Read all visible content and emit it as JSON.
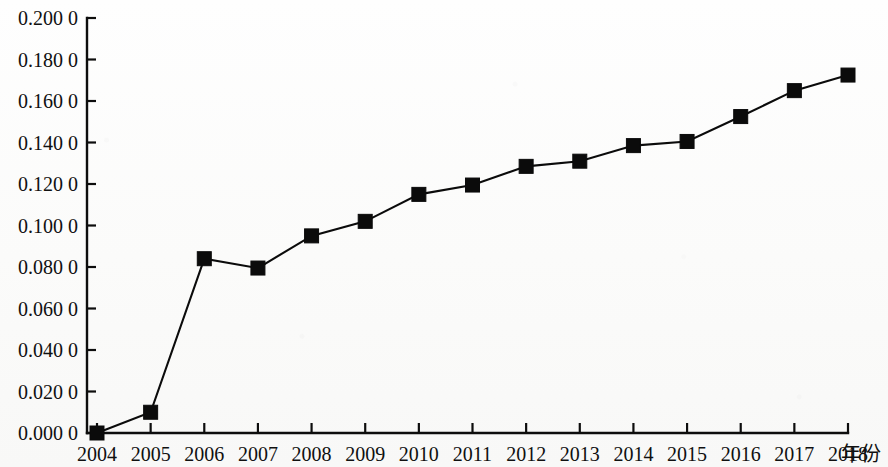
{
  "chart_data": {
    "type": "line",
    "title": "",
    "subtitle": "",
    "xlabel": "年份",
    "ylabel": "",
    "grid": false,
    "legend": null,
    "categories": [
      "2004",
      "2005",
      "2006",
      "2007",
      "2008",
      "2009",
      "2010",
      "2011",
      "2012",
      "2013",
      "2014",
      "2015",
      "2016",
      "2017",
      "2018"
    ],
    "x": [
      2004,
      2005,
      2006,
      2007,
      2008,
      2009,
      2010,
      2011,
      2012,
      2013,
      2014,
      2015,
      2016,
      2017,
      2018
    ],
    "values": [
      0.0,
      0.01,
      0.084,
      0.0795,
      0.095,
      0.102,
      0.115,
      0.1195,
      0.1285,
      0.131,
      0.1385,
      0.1405,
      0.1525,
      0.165,
      0.1725
    ],
    "series": [
      {
        "name": "series-1",
        "marker": "filled-square",
        "color": "#0b0b0b",
        "values": [
          0.0,
          0.01,
          0.084,
          0.0795,
          0.095,
          0.102,
          0.115,
          0.1195,
          0.1285,
          0.131,
          0.1385,
          0.1405,
          0.1525,
          0.165,
          0.1725
        ]
      }
    ],
    "ylim": [
      0.0,
      0.2
    ],
    "xlim": [
      2004,
      2018
    ],
    "ytick_values": [
      0.0,
      0.02,
      0.04,
      0.06,
      0.08,
      0.1,
      0.12,
      0.14,
      0.16,
      0.18,
      0.2
    ],
    "ytick_labels": [
      "0.000 0",
      "0.020 0",
      "0.040 0",
      "0.060 0",
      "0.080 0",
      "0.100 0",
      "0.120 0",
      "0.140 0",
      "0.160 0",
      "0.180 0",
      "0.200 0"
    ],
    "xtick_labels": [
      "2004",
      "2005",
      "2006",
      "2007",
      "2008",
      "2009",
      "2010",
      "2011",
      "2012",
      "2013",
      "2014",
      "2015",
      "2016",
      "2017",
      "2018"
    ],
    "axis_color": "#0d0d0d",
    "background_color": "#fdfdfc"
  }
}
